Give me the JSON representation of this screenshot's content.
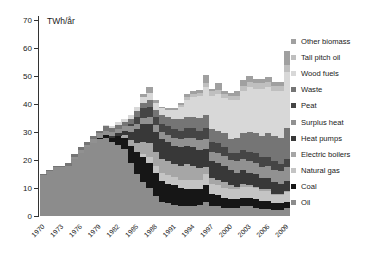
{
  "chart_data": {
    "type": "bar",
    "stacked": true,
    "title": "TWh/år",
    "ylabel": "TWh/år",
    "xlabel": "",
    "ylim": [
      0,
      70
    ],
    "yticks": [
      0,
      10,
      20,
      30,
      40,
      50,
      60,
      70
    ],
    "grid": false,
    "legend_position": "right",
    "x": [
      1970,
      1971,
      1972,
      1973,
      1974,
      1975,
      1976,
      1977,
      1978,
      1979,
      1980,
      1981,
      1982,
      1983,
      1984,
      1985,
      1986,
      1987,
      1988,
      1989,
      1990,
      1991,
      1992,
      1993,
      1994,
      1995,
      1996,
      1997,
      1998,
      1999,
      2000,
      2001,
      2002,
      2003,
      2004,
      2005,
      2006,
      2007,
      2008,
      2009
    ],
    "xtick_labels": [
      "1970",
      "1973",
      "1976",
      "1979",
      "1982",
      "1985",
      "1988",
      "1991",
      "1994",
      "1997",
      "2000",
      "2003",
      "2006",
      "2009"
    ],
    "xtick_every": 3,
    "legend_order_top_to_bottom": [
      "Other biomass",
      "Tall pitch oil",
      "Wood fuels",
      "Waste",
      "Peat",
      "Surplus heat",
      "Heat pumps",
      "Electric boilers",
      "Natural gas",
      "Coal",
      "Oil"
    ],
    "series": [
      {
        "name": "Oil",
        "color": "#8c8c8c",
        "values": [
          14.5,
          16,
          17.5,
          17.5,
          18,
          20.5,
          22.5,
          24.5,
          26,
          27.5,
          28,
          26.5,
          25.5,
          24,
          19,
          15,
          12,
          10,
          7,
          5,
          4.5,
          4,
          3.5,
          3.5,
          3.5,
          4,
          5,
          3.5,
          3.5,
          3,
          3,
          3,
          3.5,
          3.5,
          3,
          2.5,
          2.5,
          2,
          2,
          3
        ]
      },
      {
        "name": "Coal",
        "color": "#161616",
        "values": [
          0,
          0,
          0,
          0,
          0,
          0,
          0,
          0,
          0,
          0.5,
          1,
          1.5,
          3,
          4,
          6,
          8,
          9,
          9,
          8.5,
          7.5,
          7,
          7,
          6.5,
          6,
          6,
          5.5,
          6,
          4.5,
          4,
          3.5,
          3,
          3,
          3,
          3,
          3,
          3,
          3,
          2.5,
          2.5,
          2
        ]
      },
      {
        "name": "Natural gas",
        "color": "#c4c4c4",
        "values": [
          0,
          0,
          0,
          0,
          0,
          0,
          0,
          0,
          0,
          0,
          0,
          0,
          0,
          0,
          0,
          0,
          1,
          2,
          2.5,
          3,
          3,
          3,
          3,
          3.5,
          3.5,
          3.5,
          4,
          3.5,
          3.5,
          3.5,
          3.5,
          3.5,
          4,
          4,
          4,
          3.5,
          3.5,
          3,
          3,
          3.5
        ]
      },
      {
        "name": "Electric boilers",
        "color": "#a6a6a6",
        "values": [
          0,
          0,
          0,
          0,
          0,
          0,
          0,
          0,
          0,
          0,
          0,
          0,
          0,
          1,
          2,
          3,
          4.5,
          5,
          5,
          5,
          5,
          4.5,
          5,
          5.5,
          5,
          4,
          2.5,
          2,
          2,
          2,
          1.5,
          1,
          1,
          0.5,
          0.5,
          0.5,
          0.5,
          0.5,
          0.5,
          0.5
        ]
      },
      {
        "name": "Heat pumps",
        "color": "#383838",
        "values": [
          0,
          0,
          0,
          0,
          0,
          0,
          0,
          0,
          0,
          0,
          0,
          0.5,
          1,
          1.5,
          3,
          5,
          6.5,
          7,
          7,
          7,
          7,
          6.5,
          6.5,
          6.5,
          6.5,
          6.5,
          6.5,
          6,
          6,
          6,
          5.5,
          5,
          5,
          4.5,
          4.5,
          4,
          4,
          4,
          3.5,
          3.5
        ]
      },
      {
        "name": "Surplus heat",
        "color": "#919191",
        "values": [
          0,
          0,
          0,
          0,
          0,
          0.5,
          1,
          1,
          1.5,
          1.5,
          1.5,
          1.5,
          1.5,
          1.5,
          2,
          2,
          2,
          2.5,
          2.5,
          2.5,
          2.5,
          3,
          3,
          3,
          3.5,
          3.5,
          3.5,
          3.5,
          3.5,
          3.5,
          3.5,
          4,
          4,
          4,
          4,
          4,
          4.5,
          4.5,
          4.5,
          5
        ]
      },
      {
        "name": "Peat",
        "color": "#454545",
        "values": [
          0,
          0,
          0,
          0,
          0,
          0,
          0,
          0,
          0,
          0,
          0,
          0,
          0,
          0,
          1,
          2.5,
          3.5,
          3.5,
          3,
          3,
          3,
          3,
          3,
          3.5,
          3.5,
          3.5,
          4,
          3.5,
          3.5,
          3,
          2.5,
          3,
          3,
          3.5,
          3.5,
          3.5,
          3,
          3,
          2.5,
          3
        ]
      },
      {
        "name": "Waste",
        "color": "#757575",
        "values": [
          0.5,
          0.5,
          0.5,
          0.5,
          1,
          1,
          1,
          1,
          1,
          1,
          1.5,
          1.5,
          1.5,
          1.5,
          1.5,
          2,
          2,
          2.5,
          2.5,
          3,
          3.5,
          3.5,
          4,
          4,
          4,
          4.5,
          4.5,
          4.5,
          4.5,
          5,
          5,
          5.5,
          6,
          7,
          7,
          7.5,
          8.5,
          9,
          9.5,
          11
        ]
      },
      {
        "name": "Wood fuels",
        "color": "#d8d8d8",
        "values": [
          0,
          0,
          0,
          0,
          0,
          0,
          0,
          0,
          0,
          0,
          0.5,
          0.5,
          1,
          1,
          1.5,
          1.5,
          2,
          2.5,
          2.5,
          2.5,
          2.5,
          3.5,
          4.5,
          6,
          7,
          8,
          10,
          12,
          13,
          12.5,
          14,
          13.5,
          15,
          16,
          16,
          17,
          16.5,
          16,
          16.5,
          20
        ]
      },
      {
        "name": "Tall pitch oil",
        "color": "#bfbfbf",
        "values": [
          0,
          0,
          0,
          0,
          0,
          0,
          0,
          0,
          0,
          0,
          0,
          0,
          0,
          0,
          0,
          0,
          0,
          0,
          0,
          0,
          0,
          0,
          0.5,
          1,
          1,
          1,
          1.5,
          1.5,
          1.5,
          1.5,
          1.5,
          1.5,
          2,
          2,
          2,
          2,
          2,
          2,
          2,
          2.5
        ]
      },
      {
        "name": "Other biomass",
        "color": "#a0a0a0",
        "values": [
          0,
          0,
          0,
          0,
          0,
          0,
          0,
          0,
          0,
          0,
          0,
          0,
          0,
          0,
          0,
          0,
          1,
          2,
          1,
          0.5,
          0.5,
          0.5,
          1,
          1,
          1,
          1,
          3,
          1,
          2.5,
          1,
          1,
          1.5,
          2,
          2,
          1.5,
          1.5,
          1.5,
          1.5,
          1.5,
          5
        ]
      }
    ]
  },
  "style": {
    "axis_color": "#333333",
    "text_color": "#1a1a1a",
    "background": "#ffffff"
  }
}
